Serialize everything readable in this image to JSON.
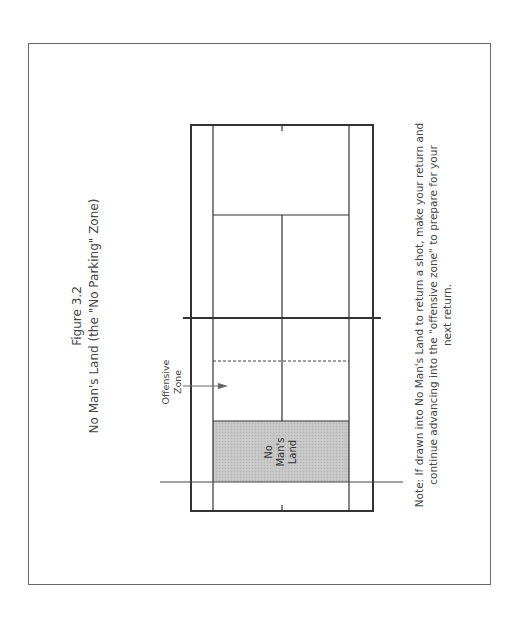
{
  "figure": {
    "label": "Figure 3.2",
    "title": "No Man's Land (the \"No Parking\" Zone)"
  },
  "court": {
    "orientation": "rotated -90deg (text reads bottom-to-top)",
    "no_mans_land_fill": "#c4c4c4",
    "line_color": "#333333"
  },
  "labels": {
    "offensive_zone_line1": "Offensive",
    "offensive_zone_line2": "Zone",
    "no_mans_land_line1": "No",
    "no_mans_land_line2": "Man's",
    "no_mans_land_line3": "Land"
  },
  "note": {
    "line1": "Note: If drawn into No Man's Land to return a shot, make your return and",
    "line2": "continue advancing into the \"offensive zone\" to prepare for your",
    "line3": "next return."
  }
}
